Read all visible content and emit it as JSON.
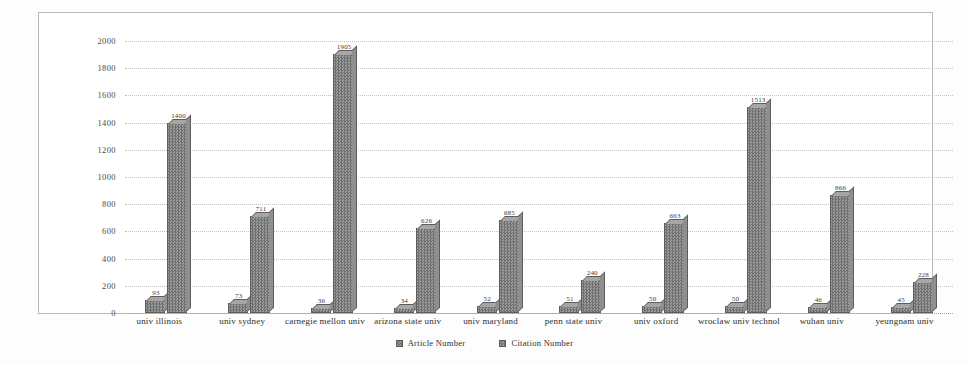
{
  "chart_data": {
    "type": "bar",
    "title": "",
    "xlabel": "",
    "ylabel": "",
    "ylim": [
      0,
      2000
    ],
    "yticks": [
      0,
      200,
      400,
      600,
      800,
      1000,
      1200,
      1400,
      1600,
      1800,
      2000
    ],
    "ytick_labels": [
      "0",
      "200",
      "400",
      "600",
      "800",
      "1000",
      "1200",
      "1400",
      "1600",
      "1800",
      "2000"
    ],
    "grid": true,
    "legend_position": "bottom",
    "categories": [
      "univ illinois",
      "univ sydney",
      "carnegie mellon univ",
      "arizona state univ",
      "univ maryland",
      "penn state univ",
      "univ oxford",
      "wroclaw univ technol",
      "wuhan univ",
      "yeungnam univ"
    ],
    "series": [
      {
        "name": "Article Number",
        "values": [
          93,
          73,
          36,
          34,
          52,
          51,
          50,
          50,
          46,
          45
        ],
        "labels": [
          "93",
          "73",
          "36",
          "34",
          "52",
          "51",
          "50",
          "50",
          "46",
          "45"
        ]
      },
      {
        "name": "Citation Number",
        "values": [
          1400,
          711,
          1905,
          626,
          685,
          240,
          663,
          1513,
          866,
          228
        ],
        "labels": [
          "1400",
          "711",
          "1905",
          "626",
          "685",
          "240",
          "663",
          "1513",
          "866",
          "228"
        ]
      }
    ]
  },
  "legend": {
    "items": [
      {
        "label": "Article Number",
        "marker": "legend-swatch-icon"
      },
      {
        "label": "Citation Number",
        "marker": "legend-swatch-icon"
      }
    ]
  }
}
